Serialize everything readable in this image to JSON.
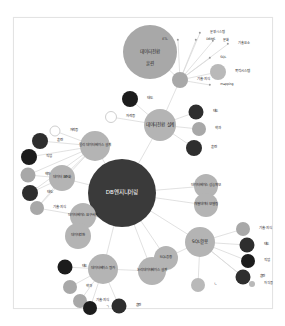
{
  "figure": {
    "kind": "force-directed-network-graph",
    "title": "DB엔지니어링",
    "background_color": "#ffffff",
    "border_color": "#e3e3e3",
    "edge_color": "#d9d9d9"
  },
  "palette": {
    "hub_dark": "#3a3a3a",
    "node_gray_light": "#b9b9b9",
    "node_gray_mid": "#a8a8a8",
    "node_gray_dark": "#6f6f6f",
    "node_black": "#1c1c1c",
    "node_black_soft": "#2e2e2e",
    "node_hollow_fill": "#ffffff",
    "node_hollow_stroke": "#cfcfcf",
    "label_dark": "#2b2b2b",
    "label_light": "#ffffff"
  },
  "nodes": [
    {
      "id": "db_engineering",
      "label": "DB엔지니어링",
      "x": 122,
      "y": 193,
      "r": 34,
      "color": "#3a3a3a",
      "label_color": "light",
      "label_size": "big",
      "label_pos": "center"
    },
    {
      "id": "data_conversion_top",
      "label": "데이터전환",
      "x": 150,
      "y": 52,
      "r": 27,
      "color": "#a8a8a8",
      "label_color": "dark",
      "label_size": "mid",
      "label_pos": "center"
    },
    {
      "id": "training_top",
      "label": "훈련",
      "x": 150,
      "y": 64,
      "r": 0,
      "color": "none",
      "label_color": "dark",
      "label_size": "mid",
      "label_pos": "center"
    },
    {
      "id": "skill_knowledge_top",
      "label": "기술·지식",
      "x": 180,
      "y": 80,
      "r": 8,
      "color": "#a8a8a8",
      "label_color": "dark",
      "label_size": "sm",
      "label_pos": "right"
    },
    {
      "id": "target_system",
      "label": "목적시스템",
      "x": 218,
      "y": 72,
      "r": 8,
      "color": "#b9b9b9",
      "label_color": "dark",
      "label_size": "sm",
      "label_pos": "right"
    },
    {
      "id": "etl",
      "label": "ETL",
      "x": 178,
      "y": 40,
      "r": 1.2,
      "color": "#9a9a9a",
      "label_color": "dark",
      "label_size": "tiny",
      "label_pos": "left"
    },
    {
      "id": "dbms",
      "label": "DBMS",
      "x": 196,
      "y": 40,
      "r": 1.2,
      "color": "#9a9a9a",
      "label_color": "dark",
      "label_size": "tiny",
      "label_pos": "right"
    },
    {
      "id": "operating_system_kw",
      "label": "운영시스템",
      "x": 200,
      "y": 33,
      "r": 1.2,
      "color": "#9a9a9a",
      "label_color": "dark",
      "label_size": "tiny",
      "label_pos": "right"
    },
    {
      "id": "culture",
      "label": "문화",
      "x": 213,
      "y": 41,
      "r": 1.2,
      "color": "#9a9a9a",
      "label_color": "dark",
      "label_size": "tiny",
      "label_pos": "right"
    },
    {
      "id": "tech_element",
      "label": "기술요소",
      "x": 228,
      "y": 44,
      "r": 1.2,
      "color": "#9a9a9a",
      "label_color": "dark",
      "label_size": "tiny",
      "label_pos": "right"
    },
    {
      "id": "sql_kw",
      "label": "SQL",
      "x": 210,
      "y": 58,
      "r": 1.2,
      "color": "#9a9a9a",
      "label_color": "dark",
      "label_size": "tiny",
      "label_pos": "right"
    },
    {
      "id": "mapping",
      "label": "mapping",
      "x": 210,
      "y": 85,
      "r": 1.2,
      "color": "#9a9a9a",
      "label_color": "dark",
      "label_size": "tiny",
      "label_pos": "right"
    },
    {
      "id": "conversion_design",
      "label": "데이터전환 설계",
      "x": 160,
      "y": 125,
      "r": 16,
      "color": "#b4b4b4",
      "label_color": "dark",
      "label_size": "mid",
      "label_pos": "center"
    },
    {
      "id": "attitude_top",
      "label": "태도",
      "x": 130,
      "y": 99,
      "r": 8,
      "color": "#1c1c1c",
      "label_color": "dark",
      "label_size": "sm",
      "label_pos": "right"
    },
    {
      "id": "cert_top",
      "label": "자격증",
      "x": 111,
      "y": 117,
      "r": 6,
      "color": "#ffffff",
      "label_color": "dark",
      "label_size": "sm",
      "label_pos": "right",
      "hollow": true
    },
    {
      "id": "attitude_r1",
      "label": "태도",
      "x": 196,
      "y": 112,
      "r": 7.5,
      "color": "#2e2e2e",
      "label_color": "dark",
      "label_size": "sm",
      "label_pos": "right"
    },
    {
      "id": "dept_r1",
      "label": "학과",
      "x": 199,
      "y": 129,
      "r": 7,
      "color": "#a8a8a8",
      "label_color": "dark",
      "label_size": "sm",
      "label_pos": "right"
    },
    {
      "id": "training_r1",
      "label": "훈련",
      "x": 194,
      "y": 148,
      "r": 8,
      "color": "#2e2e2e",
      "label_color": "dark",
      "label_size": "sm",
      "label_pos": "right"
    },
    {
      "id": "db_performance",
      "label": "데이터베이스 성능확보",
      "x": 206,
      "y": 186,
      "r": 12,
      "color": "#b4b4b4",
      "label_color": "dark",
      "label_size": "sm",
      "label_pos": "center"
    },
    {
      "id": "data_modeling",
      "label": "개별데이터 모델링",
      "x": 206,
      "y": 205,
      "r": 12,
      "color": "#b4b4b4",
      "label_color": "dark",
      "label_size": "sm",
      "label_pos": "center"
    },
    {
      "id": "sql_usage",
      "label": "SQL활용",
      "x": 200,
      "y": 242,
      "r": 15,
      "color": "#b4b4b4",
      "label_color": "dark",
      "label_size": "mid",
      "label_pos": "center"
    },
    {
      "id": "skill_r2",
      "label": "기술·지식",
      "x": 243,
      "y": 229,
      "r": 7,
      "color": "#a8a8a8",
      "label_color": "dark",
      "label_size": "sm",
      "label_pos": "right"
    },
    {
      "id": "attitude_r2",
      "label": "태도",
      "x": 247,
      "y": 245,
      "r": 7.5,
      "color": "#2e2e2e",
      "label_color": "dark",
      "label_size": "sm",
      "label_pos": "right"
    },
    {
      "id": "job_r2",
      "label": "직업",
      "x": 248,
      "y": 261,
      "r": 7,
      "color": "#1c1c1c",
      "label_color": "dark",
      "label_size": "sm",
      "label_pos": "right"
    },
    {
      "id": "training_r2",
      "label": "훈련",
      "x": 243,
      "y": 277,
      "r": 7.5,
      "color": "#2e2e2e",
      "label_color": "dark",
      "label_size": "sm",
      "label_pos": "right"
    },
    {
      "id": "cert_r2",
      "label": "자격증",
      "x": 252,
      "y": 284,
      "r": 3,
      "color": "#b9b9b9",
      "label_color": "dark",
      "label_size": "tiny",
      "label_pos": "right"
    },
    {
      "id": "req_analysis",
      "label": "ㄴ",
      "x": 198,
      "y": 285,
      "r": 7,
      "color": "#b9b9b9",
      "label_color": "dark",
      "label_size": "sm",
      "label_pos": "right"
    },
    {
      "id": "data_standard",
      "label": "데이터 표준화",
      "x": 62,
      "y": 178,
      "r": 13,
      "color": "#b4b4b4",
      "label_color": "dark",
      "label_size": "sm",
      "label_pos": "center"
    },
    {
      "id": "db_requirement",
      "label": "데이터베이스 요구사항",
      "x": 83,
      "y": 216,
      "r": 13,
      "color": "#b4b4b4",
      "label_color": "dark",
      "label_size": "sm",
      "label_pos": "center"
    },
    {
      "id": "data_conversion_l",
      "label": "데이터전환",
      "x": 78,
      "y": 236,
      "r": 13,
      "color": "#b4b4b4",
      "label_color": "dark",
      "label_size": "sm",
      "label_pos": "center"
    },
    {
      "id": "training_l1",
      "label": "훈련",
      "x": 40,
      "y": 141,
      "r": 8,
      "color": "#2e2e2e",
      "label_color": "dark",
      "label_size": "sm",
      "label_pos": "right"
    },
    {
      "id": "cert_l1",
      "label": "자격증",
      "x": 55,
      "y": 131,
      "r": 5.5,
      "color": "#ffffff",
      "label_color": "dark",
      "label_size": "sm",
      "label_pos": "right",
      "hollow": true
    },
    {
      "id": "job_l1",
      "label": "직업",
      "x": 29,
      "y": 157,
      "r": 8,
      "color": "#1c1c1c",
      "label_color": "dark",
      "label_size": "sm",
      "label_pos": "right"
    },
    {
      "id": "dept_l1",
      "label": "학과",
      "x": 28,
      "y": 175,
      "r": 7.5,
      "color": "#a8a8a8",
      "label_color": "dark",
      "label_size": "sm",
      "label_pos": "right"
    },
    {
      "id": "attitude_l1",
      "label": "태도",
      "x": 30,
      "y": 193,
      "r": 8,
      "color": "#2e2e2e",
      "label_color": "dark",
      "label_size": "sm",
      "label_pos": "right"
    },
    {
      "id": "skill_l1",
      "label": "기술·지식",
      "x": 37,
      "y": 208,
      "r": 7,
      "color": "#a8a8a8",
      "label_color": "dark",
      "label_size": "sm",
      "label_pos": "right"
    },
    {
      "id": "physical_db_design",
      "label": "물리 데이터베이스 설계",
      "x": 95,
      "y": 146,
      "r": 15,
      "color": "#b4b4b4",
      "label_color": "dark",
      "label_size": "sm",
      "label_pos": "center"
    },
    {
      "id": "db_evaluation",
      "label": "데이터베이스 평가",
      "x": 103,
      "y": 269,
      "r": 15,
      "color": "#b4b4b4",
      "label_color": "dark",
      "label_size": "sm",
      "label_pos": "center"
    },
    {
      "id": "logical_db_design",
      "label": "논리데이터베이스 설계",
      "x": 152,
      "y": 271,
      "r": 14,
      "color": "#b4b4b4",
      "label_color": "dark",
      "label_size": "sm",
      "label_pos": "center"
    },
    {
      "id": "sql_application",
      "label": "SQL응용",
      "x": 166,
      "y": 258,
      "r": 12,
      "color": "#b4b4b4",
      "label_color": "dark",
      "label_size": "sm",
      "label_pos": "center"
    },
    {
      "id": "attitude_b1",
      "label": "태도",
      "x": 65,
      "y": 267,
      "r": 7.5,
      "color": "#1c1c1c",
      "label_color": "dark",
      "label_size": "sm",
      "label_pos": "right"
    },
    {
      "id": "dept_b1",
      "label": "학과",
      "x": 70,
      "y": 287,
      "r": 7,
      "color": "#a8a8a8",
      "label_color": "dark",
      "label_size": "sm",
      "label_pos": "right"
    },
    {
      "id": "skill_b1",
      "label": "기술·지식",
      "x": 80,
      "y": 301,
      "r": 7,
      "color": "#a8a8a8",
      "label_color": "dark",
      "label_size": "sm",
      "label_pos": "right"
    },
    {
      "id": "job_b1",
      "label": "ㄱ",
      "x": 90,
      "y": 308,
      "r": 7,
      "color": "#1c1c1c",
      "label_color": "dark",
      "label_size": "sm",
      "label_pos": "right"
    },
    {
      "id": "training_b1",
      "label": "훈련",
      "x": 119,
      "y": 306,
      "r": 7.5,
      "color": "#2e2e2e",
      "label_color": "dark",
      "label_size": "sm",
      "label_pos": "right"
    }
  ],
  "edges": [
    {
      "from": "data_conversion_top",
      "to": "skill_knowledge_top"
    },
    {
      "from": "skill_knowledge_top",
      "to": "etl"
    },
    {
      "from": "skill_knowledge_top",
      "to": "dbms"
    },
    {
      "from": "skill_knowledge_top",
      "to": "operating_system_kw"
    },
    {
      "from": "skill_knowledge_top",
      "to": "culture"
    },
    {
      "from": "skill_knowledge_top",
      "to": "tech_element"
    },
    {
      "from": "skill_knowledge_top",
      "to": "sql_kw"
    },
    {
      "from": "skill_knowledge_top",
      "to": "mapping"
    },
    {
      "from": "skill_knowledge_top",
      "to": "target_system"
    },
    {
      "from": "skill_knowledge_top",
      "to": "conversion_design"
    },
    {
      "from": "conversion_design",
      "to": "attitude_top"
    },
    {
      "from": "conversion_design",
      "to": "cert_top"
    },
    {
      "from": "conversion_design",
      "to": "attitude_r1"
    },
    {
      "from": "conversion_design",
      "to": "dept_r1"
    },
    {
      "from": "conversion_design",
      "to": "training_r1"
    },
    {
      "from": "conversion_design",
      "to": "db_engineering"
    },
    {
      "from": "db_engineering",
      "to": "db_performance"
    },
    {
      "from": "db_engineering",
      "to": "data_modeling"
    },
    {
      "from": "db_engineering",
      "to": "sql_usage"
    },
    {
      "from": "db_engineering",
      "to": "data_standard"
    },
    {
      "from": "db_engineering",
      "to": "db_requirement"
    },
    {
      "from": "db_engineering",
      "to": "data_conversion_l"
    },
    {
      "from": "db_engineering",
      "to": "physical_db_design"
    },
    {
      "from": "db_engineering",
      "to": "db_evaluation"
    },
    {
      "from": "db_engineering",
      "to": "logical_db_design"
    },
    {
      "from": "db_engineering",
      "to": "sql_application"
    },
    {
      "from": "sql_usage",
      "to": "skill_r2"
    },
    {
      "from": "sql_usage",
      "to": "attitude_r2"
    },
    {
      "from": "sql_usage",
      "to": "job_r2"
    },
    {
      "from": "sql_usage",
      "to": "training_r2"
    },
    {
      "from": "sql_usage",
      "to": "cert_r2"
    },
    {
      "from": "sql_usage",
      "to": "req_analysis"
    },
    {
      "from": "physical_db_design",
      "to": "training_l1"
    },
    {
      "from": "physical_db_design",
      "to": "cert_l1"
    },
    {
      "from": "physical_db_design",
      "to": "job_l1"
    },
    {
      "from": "physical_db_design",
      "to": "dept_l1"
    },
    {
      "from": "physical_db_design",
      "to": "attitude_l1"
    },
    {
      "from": "physical_db_design",
      "to": "skill_l1"
    },
    {
      "from": "physical_db_design",
      "to": "data_standard"
    },
    {
      "from": "data_standard",
      "to": "dept_l1"
    },
    {
      "from": "data_standard",
      "to": "attitude_l1"
    },
    {
      "from": "data_standard",
      "to": "skill_l1"
    },
    {
      "from": "db_evaluation",
      "to": "attitude_b1"
    },
    {
      "from": "db_evaluation",
      "to": "dept_b1"
    },
    {
      "from": "db_evaluation",
      "to": "skill_b1"
    },
    {
      "from": "db_evaluation",
      "to": "job_b1"
    },
    {
      "from": "db_evaluation",
      "to": "training_b1"
    },
    {
      "from": "db_evaluation",
      "to": "logical_db_design"
    },
    {
      "from": "logical_db_design",
      "to": "sql_application"
    },
    {
      "from": "sql_application",
      "to": "sql_usage"
    },
    {
      "from": "db_requirement",
      "to": "data_conversion_l"
    },
    {
      "from": "db_requirement",
      "to": "skill_l1"
    }
  ]
}
